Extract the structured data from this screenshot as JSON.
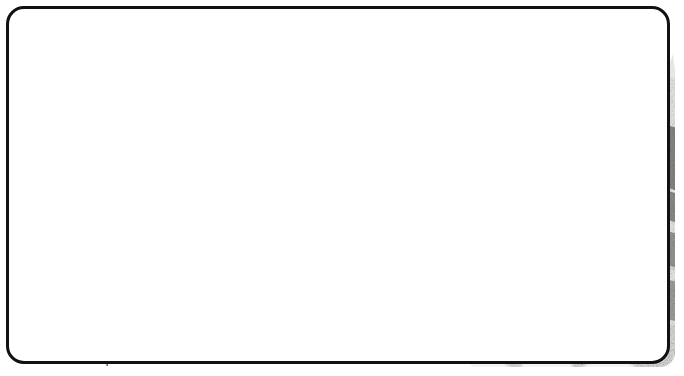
{
  "worksheet": {
    "title": "How old are the rocks ?",
    "intro": {
      "line1": "Here is a sequence of sedimentary rocks which have",
      "line2_plain": "been disturbed by earth movements.",
      "line2_bold": "Using the fossils,",
      "line3": "can you work out  which layer is the youngest",
      "line4": "and which the oldest?"
    }
  },
  "fossils": [
    {
      "id": "encrinurus",
      "label": "Encrinurus",
      "kind": "trilobite-fossil"
    },
    {
      "id": "viviparus",
      "label": "Viviparus",
      "kind": "gastropod-fossil"
    },
    {
      "id": "hoplites",
      "label": "Hoplites",
      "kind": "ammonite-fossil"
    }
  ],
  "bed_labels": [
    {
      "id": "a",
      "letter": "A"
    },
    {
      "id": "b",
      "letter": "B"
    },
    {
      "id": "c",
      "letter": "C"
    }
  ],
  "colors": {
    "ink": "#111111",
    "paper": "#ffffff",
    "rock_dark": "#7e7e7e",
    "rock_mid": "#a9a9a9",
    "rock_light": "#f2f2f2",
    "grass": "#cfcfcf"
  }
}
